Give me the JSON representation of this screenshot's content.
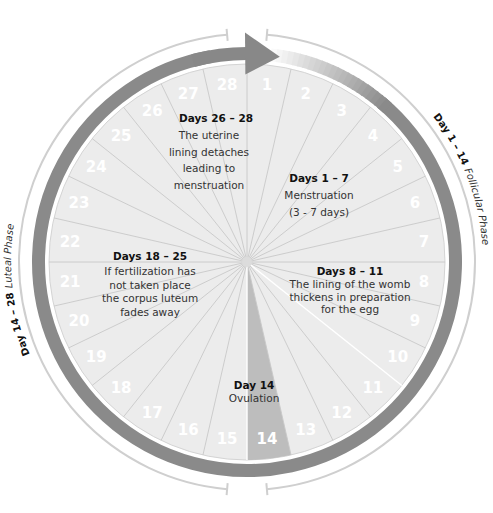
{
  "diagram": {
    "center": [
      247,
      262
    ],
    "days": [
      "1",
      "2",
      "3",
      "4",
      "5",
      "6",
      "7",
      "8",
      "9",
      "10",
      "11",
      "12",
      "13",
      "14",
      "15",
      "16",
      "17",
      "18",
      "19",
      "20",
      "21",
      "22",
      "23",
      "24",
      "25",
      "26",
      "27",
      "28"
    ],
    "highlight_day": 14,
    "colors": {
      "disc_fill": "#ececec",
      "segment_line": "#c8c8c8",
      "highlight_wedge": "#bdbdbd",
      "ring_dark": "#8a8a8a",
      "ring_light": "#cfcfcf",
      "arrow": "#888888",
      "day_number": "#ffffff"
    },
    "notes": [
      {
        "id": "days-26-28",
        "title": "Days 26 – 28",
        "lines": [
          "The uterine",
          "lining detaches",
          "leading to",
          "menstruation"
        ]
      },
      {
        "id": "days-1-7",
        "title": "Days 1 – 7",
        "lines": [
          "Menstruation",
          "(3 - 7 days)"
        ]
      },
      {
        "id": "days-18-25",
        "title": "Days 18 – 25",
        "lines": [
          "If fertilization has",
          "not taken place",
          "the corpus luteum",
          "fades away"
        ]
      },
      {
        "id": "days-8-11",
        "title": "Days 8 – 11",
        "lines": [
          "The lining of the womb",
          "thickens in preparation",
          "for the egg"
        ]
      },
      {
        "id": "day-14",
        "title": "Day 14",
        "lines": [
          "Ovulation"
        ]
      }
    ],
    "phases": [
      {
        "id": "follicular",
        "range": "Day 1 – 14",
        "name": "Follicular Phase"
      },
      {
        "id": "luteal",
        "range": "Day 14 – 28",
        "name": "Luteal Phase"
      }
    ]
  }
}
